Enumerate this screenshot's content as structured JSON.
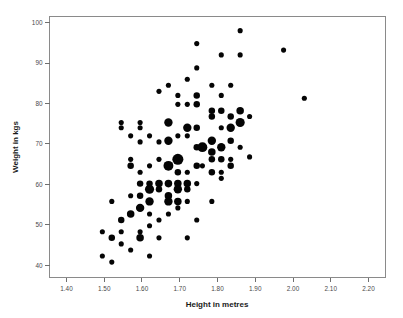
{
  "chart_data": {
    "type": "scatter",
    "title": "",
    "subtitle": "",
    "xlabel": "Height in metres",
    "ylabel": "Weight in kgs",
    "xlim": [
      1.355,
      2.245
    ],
    "ylim": [
      37.0,
      101.5
    ],
    "xticks": [
      1.4,
      1.5,
      1.6,
      1.7,
      1.8,
      1.9,
      2.0,
      2.1,
      2.2
    ],
    "xticklabels": [
      "1.40",
      "1.50",
      "1.60",
      "1.70",
      "1.80",
      "1.90",
      "2.00",
      "2.10",
      "2.20"
    ],
    "yticks": [
      40,
      50,
      60,
      70,
      80,
      90,
      100
    ],
    "yticklabels": [
      "40",
      "50",
      "60",
      "70",
      "80",
      "90",
      "100"
    ],
    "grid": false,
    "legend": false,
    "marker_color": "#050505",
    "frame_color": "#8a8a8a",
    "background": "#ffffff",
    "size_encoding": "count",
    "size_note": "Marker area encodes number of overlapping observations",
    "points": [
      {
        "x": 1.495,
        "y": 48.3,
        "n": 1
      },
      {
        "x": 1.495,
        "y": 42.3,
        "n": 1
      },
      {
        "x": 1.52,
        "y": 46.8,
        "n": 2
      },
      {
        "x": 1.52,
        "y": 55.8,
        "n": 1
      },
      {
        "x": 1.52,
        "y": 40.8,
        "n": 1
      },
      {
        "x": 1.545,
        "y": 74.0,
        "n": 1
      },
      {
        "x": 1.545,
        "y": 48.3,
        "n": 1
      },
      {
        "x": 1.545,
        "y": 51.2,
        "n": 2
      },
      {
        "x": 1.545,
        "y": 45.3,
        "n": 1
      },
      {
        "x": 1.545,
        "y": 75.3,
        "n": 1
      },
      {
        "x": 1.57,
        "y": 66.2,
        "n": 1
      },
      {
        "x": 1.57,
        "y": 64.6,
        "n": 2
      },
      {
        "x": 1.57,
        "y": 57.2,
        "n": 1
      },
      {
        "x": 1.57,
        "y": 52.7,
        "n": 3
      },
      {
        "x": 1.57,
        "y": 43.8,
        "n": 1
      },
      {
        "x": 1.57,
        "y": 72.0,
        "n": 1
      },
      {
        "x": 1.595,
        "y": 75.3,
        "n": 1
      },
      {
        "x": 1.595,
        "y": 74.0,
        "n": 1
      },
      {
        "x": 1.595,
        "y": 70.5,
        "n": 1
      },
      {
        "x": 1.595,
        "y": 63.0,
        "n": 1
      },
      {
        "x": 1.595,
        "y": 60.2,
        "n": 2
      },
      {
        "x": 1.595,
        "y": 57.2,
        "n": 2
      },
      {
        "x": 1.595,
        "y": 54.2,
        "n": 4
      },
      {
        "x": 1.595,
        "y": 48.3,
        "n": 1
      },
      {
        "x": 1.595,
        "y": 46.8,
        "n": 3
      },
      {
        "x": 1.62,
        "y": 72.0,
        "n": 1
      },
      {
        "x": 1.62,
        "y": 64.6,
        "n": 1
      },
      {
        "x": 1.62,
        "y": 60.2,
        "n": 2
      },
      {
        "x": 1.62,
        "y": 58.8,
        "n": 5
      },
      {
        "x": 1.62,
        "y": 55.8,
        "n": 4
      },
      {
        "x": 1.62,
        "y": 52.7,
        "n": 1
      },
      {
        "x": 1.62,
        "y": 49.8,
        "n": 1
      },
      {
        "x": 1.62,
        "y": 42.3,
        "n": 1
      },
      {
        "x": 1.645,
        "y": 83.0,
        "n": 1
      },
      {
        "x": 1.645,
        "y": 70.5,
        "n": 1
      },
      {
        "x": 1.645,
        "y": 66.2,
        "n": 1
      },
      {
        "x": 1.645,
        "y": 60.2,
        "n": 3
      },
      {
        "x": 1.645,
        "y": 58.8,
        "n": 2
      },
      {
        "x": 1.645,
        "y": 51.2,
        "n": 1
      },
      {
        "x": 1.645,
        "y": 46.8,
        "n": 1
      },
      {
        "x": 1.67,
        "y": 84.5,
        "n": 1
      },
      {
        "x": 1.67,
        "y": 75.3,
        "n": 4
      },
      {
        "x": 1.67,
        "y": 70.8,
        "n": 4
      },
      {
        "x": 1.67,
        "y": 64.6,
        "n": 6
      },
      {
        "x": 1.67,
        "y": 60.2,
        "n": 3
      },
      {
        "x": 1.67,
        "y": 57.2,
        "n": 3
      },
      {
        "x": 1.67,
        "y": 55.8,
        "n": 4
      },
      {
        "x": 1.67,
        "y": 52.7,
        "n": 1
      },
      {
        "x": 1.695,
        "y": 82.0,
        "n": 1
      },
      {
        "x": 1.695,
        "y": 79.8,
        "n": 1
      },
      {
        "x": 1.695,
        "y": 72.0,
        "n": 1
      },
      {
        "x": 1.695,
        "y": 66.2,
        "n": 8
      },
      {
        "x": 1.695,
        "y": 63.0,
        "n": 2
      },
      {
        "x": 1.695,
        "y": 60.2,
        "n": 3
      },
      {
        "x": 1.695,
        "y": 58.8,
        "n": 4
      },
      {
        "x": 1.695,
        "y": 55.8,
        "n": 3
      },
      {
        "x": 1.695,
        "y": 54.2,
        "n": 1
      },
      {
        "x": 1.72,
        "y": 86.0,
        "n": 1
      },
      {
        "x": 1.72,
        "y": 79.8,
        "n": 1
      },
      {
        "x": 1.72,
        "y": 74.0,
        "n": 4
      },
      {
        "x": 1.72,
        "y": 72.0,
        "n": 1
      },
      {
        "x": 1.72,
        "y": 63.0,
        "n": 1
      },
      {
        "x": 1.72,
        "y": 60.2,
        "n": 3
      },
      {
        "x": 1.72,
        "y": 58.8,
        "n": 2
      },
      {
        "x": 1.72,
        "y": 55.8,
        "n": 1
      },
      {
        "x": 1.72,
        "y": 46.8,
        "n": 1
      },
      {
        "x": 1.745,
        "y": 94.8,
        "n": 1
      },
      {
        "x": 1.745,
        "y": 88.8,
        "n": 1
      },
      {
        "x": 1.745,
        "y": 82.0,
        "n": 2
      },
      {
        "x": 1.745,
        "y": 79.8,
        "n": 2
      },
      {
        "x": 1.745,
        "y": 74.0,
        "n": 2
      },
      {
        "x": 1.745,
        "y": 69.2,
        "n": 2
      },
      {
        "x": 1.745,
        "y": 64.6,
        "n": 2
      },
      {
        "x": 1.745,
        "y": 60.2,
        "n": 1
      },
      {
        "x": 1.745,
        "y": 51.2,
        "n": 1
      },
      {
        "x": 1.76,
        "y": 69.2,
        "n": 6
      },
      {
        "x": 1.76,
        "y": 64.6,
        "n": 1
      },
      {
        "x": 1.785,
        "y": 84.5,
        "n": 1
      },
      {
        "x": 1.785,
        "y": 78.2,
        "n": 2
      },
      {
        "x": 1.785,
        "y": 76.8,
        "n": 2
      },
      {
        "x": 1.785,
        "y": 70.8,
        "n": 4
      },
      {
        "x": 1.785,
        "y": 68.0,
        "n": 3
      },
      {
        "x": 1.785,
        "y": 66.2,
        "n": 2
      },
      {
        "x": 1.785,
        "y": 63.0,
        "n": 2
      },
      {
        "x": 1.785,
        "y": 55.8,
        "n": 1
      },
      {
        "x": 1.81,
        "y": 92.0,
        "n": 1
      },
      {
        "x": 1.81,
        "y": 82.0,
        "n": 1
      },
      {
        "x": 1.81,
        "y": 78.2,
        "n": 2
      },
      {
        "x": 1.81,
        "y": 74.0,
        "n": 1
      },
      {
        "x": 1.81,
        "y": 69.2,
        "n": 4
      },
      {
        "x": 1.81,
        "y": 66.2,
        "n": 2
      },
      {
        "x": 1.81,
        "y": 63.0,
        "n": 1
      },
      {
        "x": 1.81,
        "y": 61.5,
        "n": 1
      },
      {
        "x": 1.835,
        "y": 84.5,
        "n": 1
      },
      {
        "x": 1.835,
        "y": 76.8,
        "n": 2
      },
      {
        "x": 1.835,
        "y": 74.0,
        "n": 4
      },
      {
        "x": 1.835,
        "y": 70.8,
        "n": 2
      },
      {
        "x": 1.835,
        "y": 66.2,
        "n": 1
      },
      {
        "x": 1.835,
        "y": 64.6,
        "n": 2
      },
      {
        "x": 1.86,
        "y": 98.0,
        "n": 1
      },
      {
        "x": 1.86,
        "y": 92.0,
        "n": 1
      },
      {
        "x": 1.86,
        "y": 78.2,
        "n": 3
      },
      {
        "x": 1.86,
        "y": 75.3,
        "n": 5
      },
      {
        "x": 1.86,
        "y": 69.2,
        "n": 1
      },
      {
        "x": 1.885,
        "y": 76.8,
        "n": 1
      },
      {
        "x": 1.885,
        "y": 66.8,
        "n": 1
      },
      {
        "x": 1.975,
        "y": 93.2,
        "n": 1
      },
      {
        "x": 2.03,
        "y": 81.3,
        "n": 1
      }
    ]
  },
  "axes": {
    "x_title": "Height in metres",
    "y_title": "Weight in kgs"
  }
}
